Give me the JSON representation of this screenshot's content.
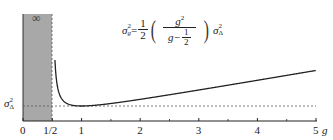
{
  "chart_data": {
    "type": "line",
    "title": "",
    "formula": {
      "lhs": "σ",
      "lhs_sup": "2",
      "lhs_sub": "g",
      "equals": "=",
      "coef_num": "1",
      "coef_den": "2",
      "frac_num": "g",
      "frac_num_sup": "2",
      "frac_den_pre": "g−",
      "frac_den_num": "1",
      "frac_den_den": "2",
      "rhs": "σ",
      "rhs_sup": "2",
      "rhs_sub": "Δ"
    },
    "xlabel": "g",
    "ylabel": "",
    "x_ticks": [
      {
        "value": 0,
        "label": "0"
      },
      {
        "value": 0.5,
        "label": "1/2"
      },
      {
        "value": 1,
        "label": "1"
      },
      {
        "value": 2,
        "label": "2"
      },
      {
        "value": 3,
        "label": "3"
      },
      {
        "value": 4,
        "label": "4"
      },
      {
        "value": 5,
        "label": "5"
      }
    ],
    "minor_ticks": [
      1.5,
      2.5,
      3.5,
      4.5
    ],
    "xlim": [
      0,
      5
    ],
    "y_reference": {
      "label": "σΔ²",
      "value": 1,
      "style": "dashed"
    },
    "shaded_region": {
      "x_from": 0,
      "x_to": 0.5,
      "label": "∞",
      "color": "#a9a9a9"
    },
    "series": [
      {
        "name": "σg² / σΔ²",
        "x": [
          0.55,
          0.6,
          0.7,
          0.8,
          1.0,
          1.5,
          2.0,
          2.5,
          3.0,
          3.5,
          4.0,
          4.5,
          5.0
        ],
        "values": [
          3.03,
          1.8,
          1.23,
          1.07,
          1.0,
          1.13,
          1.33,
          1.56,
          1.8,
          2.04,
          2.29,
          2.53,
          2.78
        ]
      }
    ],
    "grid": false,
    "legend": null
  },
  "labels": {
    "y_ref_symbol": "σ",
    "y_ref_sup": "2",
    "y_ref_sub": "Δ",
    "infinity": "∞",
    "x_axis_name": "g"
  }
}
